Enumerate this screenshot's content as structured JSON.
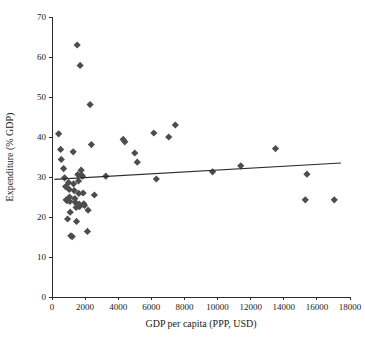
{
  "chart_data": {
    "type": "scatter",
    "title": "",
    "subtitle": "",
    "xlabel": "GDP per capita (PPP, USD)",
    "ylabel": "Expenditure (% GDP)",
    "xlim": [
      0,
      18000
    ],
    "ylim": [
      0,
      70
    ],
    "xticks": [
      0,
      2000,
      4000,
      6000,
      8000,
      10000,
      12000,
      14000,
      16000,
      18000
    ],
    "yticks": [
      0,
      10,
      20,
      30,
      40,
      50,
      60,
      70
    ],
    "xtick_labels": [
      "0",
      "2000",
      "4000",
      "6000",
      "8000",
      "10000",
      "12000",
      "14000",
      "16000",
      "18000"
    ],
    "ytick_labels": [
      "0",
      "10",
      "20",
      "30",
      "40",
      "50",
      "60",
      "70"
    ],
    "grid": false,
    "legend": null,
    "legend_position": "none",
    "marker": {
      "shape": "diamond",
      "color": "#4d4d4d",
      "size": 6
    },
    "series": [
      {
        "name": "Countries",
        "points": [
          [
            400,
            40.8
          ],
          [
            520,
            36.9
          ],
          [
            560,
            34.4
          ],
          [
            700,
            32.1
          ],
          [
            760,
            29.8
          ],
          [
            820,
            27.6
          ],
          [
            860,
            24.3
          ],
          [
            900,
            24.1
          ],
          [
            940,
            19.5
          ],
          [
            1000,
            28.6
          ],
          [
            1040,
            26.9
          ],
          [
            1060,
            25.0
          ],
          [
            1080,
            23.9
          ],
          [
            1100,
            21.2
          ],
          [
            1140,
            15.3
          ],
          [
            1220,
            15.1
          ],
          [
            1280,
            36.3
          ],
          [
            1300,
            28.3
          ],
          [
            1340,
            26.6
          ],
          [
            1380,
            24.6
          ],
          [
            1420,
            23.6
          ],
          [
            1460,
            22.4
          ],
          [
            1480,
            18.9
          ],
          [
            1520,
            63.0
          ],
          [
            1560,
            30.6
          ],
          [
            1600,
            29.0
          ],
          [
            1620,
            25.9
          ],
          [
            1640,
            23.2
          ],
          [
            1660,
            22.6
          ],
          [
            1700,
            57.9
          ],
          [
            1760,
            31.7
          ],
          [
            1800,
            30.4
          ],
          [
            1840,
            30.2
          ],
          [
            1880,
            26.0
          ],
          [
            1920,
            23.3
          ],
          [
            1960,
            22.9
          ],
          [
            2140,
            16.4
          ],
          [
            2180,
            21.7
          ],
          [
            2300,
            48.1
          ],
          [
            2380,
            38.1
          ],
          [
            2560,
            25.5
          ],
          [
            3250,
            30.2
          ],
          [
            4300,
            39.4
          ],
          [
            4400,
            38.8
          ],
          [
            5000,
            36.0
          ],
          [
            5150,
            33.7
          ],
          [
            6150,
            41.0
          ],
          [
            6300,
            29.5
          ],
          [
            7050,
            40.0
          ],
          [
            7450,
            43.0
          ],
          [
            9700,
            31.3
          ],
          [
            11400,
            32.8
          ],
          [
            13500,
            37.1
          ],
          [
            15300,
            24.3
          ],
          [
            15400,
            30.7
          ],
          [
            17050,
            24.3
          ]
        ]
      }
    ],
    "trendline": {
      "type": "linear",
      "color": "#2a2a2a",
      "x_start": 150,
      "y_start": 29.4,
      "x_end": 17450,
      "y_end": 33.5
    }
  }
}
